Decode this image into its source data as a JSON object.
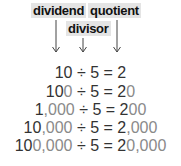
{
  "labels": {
    "dividend": "dividend",
    "divisor": "divisor",
    "quotient": "quotient"
  },
  "colors": {
    "label_bg": "#e4e4e4",
    "text_dark": "#333333",
    "added_zeros": "#8a8a8a"
  },
  "equations": [
    {
      "dividend_base": "10",
      "dividend_zeros": "",
      "operator": "÷",
      "divisor": "5",
      "equals": "=",
      "quotient_base": "2",
      "quotient_zeros": ""
    },
    {
      "dividend_base": "10",
      "dividend_zeros": "0",
      "operator": "÷",
      "divisor": "5",
      "equals": "=",
      "quotient_base": "2",
      "quotient_zeros": "0"
    },
    {
      "dividend_base": "1",
      "dividend_zeros": ",000",
      "operator": "÷",
      "divisor": "5",
      "equals": "=",
      "quotient_base": "2",
      "quotient_zeros": "00"
    },
    {
      "dividend_base": "10",
      "dividend_zeros": ",000",
      "operator": "÷",
      "divisor": "5",
      "equals": "=",
      "quotient_base": "2",
      "quotient_zeros": ",000"
    },
    {
      "dividend_base": "10",
      "dividend_zeros": "0,000",
      "operator": "÷",
      "divisor": "5",
      "equals": "=",
      "quotient_base": "2",
      "quotient_zeros": "0,000"
    }
  ]
}
